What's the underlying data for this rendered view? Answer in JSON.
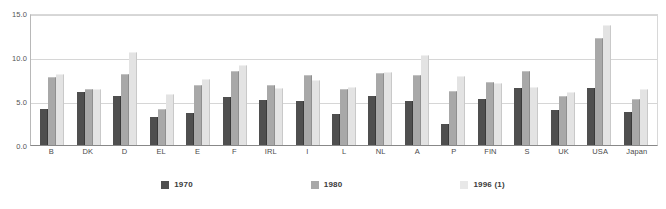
{
  "chart_data": {
    "type": "bar",
    "title": "",
    "subtitle": "",
    "xlabel": "",
    "ylabel": "",
    "ylim": [
      0.0,
      15.0
    ],
    "yticks": [
      "0.0",
      "5.0",
      "10.0",
      "15.0"
    ],
    "ytick_values": [
      0.0,
      5.0,
      10.0,
      15.0
    ],
    "grid": true,
    "legend_position": "bottom",
    "categories": [
      "B",
      "DK",
      "D",
      "EL",
      "E",
      "F",
      "IRL",
      "I",
      "L",
      "NL",
      "A",
      "P",
      "FIN",
      "S",
      "UK",
      "USA",
      "Japan"
    ],
    "series": [
      {
        "name": "1970",
        "color": "#4f4f4f",
        "values": [
          4.1,
          6.0,
          5.6,
          3.2,
          3.6,
          5.5,
          5.1,
          5.0,
          3.5,
          5.6,
          5.0,
          2.4,
          5.2,
          6.5,
          4.0,
          6.5,
          3.8
        ]
      },
      {
        "name": "1980",
        "color": "#a8a8a8",
        "values": [
          7.6,
          6.2,
          8.0,
          4.0,
          6.7,
          8.3,
          6.7,
          7.8,
          6.2,
          8.1,
          7.8,
          6.0,
          7.1,
          8.3,
          5.4,
          12.0,
          5.1
        ]
      },
      {
        "name": "1996 (1)",
        "color": "#e3e3e3",
        "values": [
          7.9,
          6.2,
          10.4,
          5.7,
          7.4,
          9.0,
          6.4,
          7.3,
          6.5,
          8.2,
          10.1,
          7.7,
          6.9,
          6.5,
          5.9,
          13.5,
          6.2
        ]
      }
    ],
    "legend": [
      "1970",
      "1980",
      "1996 (1)"
    ]
  },
  "legend": {
    "items": [
      {
        "label": "1970"
      },
      {
        "label": "1980"
      },
      {
        "label": "1996 (1)"
      }
    ]
  }
}
